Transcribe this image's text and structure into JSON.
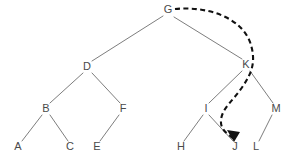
{
  "figure": {
    "type": "binary-tree-diagram",
    "background_color": "#ffffff",
    "node_text_color": "#4a4a4a",
    "edge_color": "#6e6e6e",
    "annotation_color": "#111111"
  },
  "nodes": [
    {
      "id": "G",
      "label": "G",
      "x": 168,
      "y": 10
    },
    {
      "id": "D",
      "label": "D",
      "x": 87,
      "y": 67
    },
    {
      "id": "K",
      "label": "K",
      "x": 246,
      "y": 65
    },
    {
      "id": "B",
      "label": "B",
      "x": 46,
      "y": 109
    },
    {
      "id": "F",
      "label": "F",
      "x": 123,
      "y": 109
    },
    {
      "id": "I",
      "label": "I",
      "x": 206,
      "y": 109
    },
    {
      "id": "M",
      "label": "M",
      "x": 276,
      "y": 109
    },
    {
      "id": "A",
      "label": "A",
      "x": 18,
      "y": 147
    },
    {
      "id": "C",
      "label": "C",
      "x": 70,
      "y": 147
    },
    {
      "id": "E",
      "label": "E",
      "x": 97,
      "y": 147
    },
    {
      "id": "H",
      "label": "H",
      "x": 181,
      "y": 147
    },
    {
      "id": "J",
      "label": "J",
      "x": 235,
      "y": 147
    },
    {
      "id": "L",
      "label": "L",
      "x": 256,
      "y": 147
    }
  ],
  "edges": [
    {
      "from": "G",
      "to": "D",
      "x1": 163,
      "y1": 16,
      "x2": 92,
      "y2": 61
    },
    {
      "from": "G",
      "to": "K",
      "x1": 174,
      "y1": 17,
      "x2": 242,
      "y2": 59
    },
    {
      "from": "D",
      "to": "B",
      "x1": 83,
      "y1": 73,
      "x2": 50,
      "y2": 103
    },
    {
      "from": "D",
      "to": "F",
      "x1": 92,
      "y1": 73,
      "x2": 120,
      "y2": 103
    },
    {
      "from": "B",
      "to": "A",
      "x1": 42,
      "y1": 115,
      "x2": 22,
      "y2": 141
    },
    {
      "from": "B",
      "to": "C",
      "x1": 50,
      "y1": 115,
      "x2": 68,
      "y2": 141
    },
    {
      "from": "F",
      "to": "E",
      "x1": 119,
      "y1": 115,
      "x2": 100,
      "y2": 141
    },
    {
      "from": "K",
      "to": "I",
      "x1": 242,
      "y1": 71,
      "x2": 209,
      "y2": 103
    },
    {
      "from": "K",
      "to": "M",
      "x1": 250,
      "y1": 71,
      "x2": 273,
      "y2": 103
    },
    {
      "from": "I",
      "to": "H",
      "x1": 203,
      "y1": 115,
      "x2": 184,
      "y2": 141
    },
    {
      "from": "I",
      "to": "J",
      "x1": 209,
      "y1": 115,
      "x2": 233,
      "y2": 141
    },
    {
      "from": "M",
      "to": "L",
      "x1": 272,
      "y1": 115,
      "x2": 259,
      "y2": 141
    }
  ],
  "annotation": {
    "name": "dashed-traversal-arrow",
    "from_node": "G",
    "to_node": "J",
    "style": "dashed-curve-with-arrowhead",
    "path": "M 175 9 C 205 6, 240 16, 250 42 C 257 62, 251 74, 243 86 C 234 100, 222 108, 221 120 C 220 130, 228 134, 234 139",
    "arrow_head_points": "234,142 227,130 240,132"
  }
}
